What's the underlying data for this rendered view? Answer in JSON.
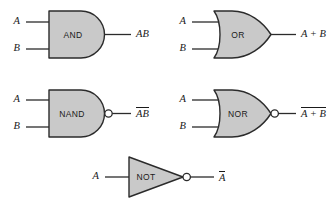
{
  "diagram": {
    "background_color": "#ffffff",
    "gate_fill_color": "#c9c9c9",
    "line_color": "#2b2b2b",
    "gates": [
      {
        "id": "and",
        "label": "AND",
        "shape": "and-gate",
        "inverted": false,
        "inputs": [
          "A",
          "B"
        ],
        "output_text": "AB",
        "output_overbar": false
      },
      {
        "id": "or",
        "label": "OR",
        "shape": "or-gate",
        "inverted": false,
        "inputs": [
          "A",
          "B"
        ],
        "output_text": "A + B",
        "output_overbar": false
      },
      {
        "id": "nand",
        "label": "NAND",
        "shape": "and-gate",
        "inverted": true,
        "inputs": [
          "A",
          "B"
        ],
        "output_text": "AB",
        "output_overbar": true
      },
      {
        "id": "nor",
        "label": "NOR",
        "shape": "or-gate",
        "inverted": true,
        "inputs": [
          "A",
          "B"
        ],
        "output_text": "A + B",
        "output_overbar": true
      },
      {
        "id": "not",
        "label": "NOT",
        "shape": "triangle",
        "inverted": true,
        "inputs": [
          "A"
        ],
        "output_text": "A",
        "output_overbar": true
      }
    ]
  }
}
